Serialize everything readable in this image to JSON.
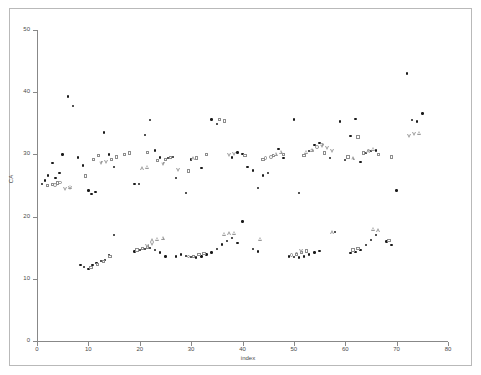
{
  "chart_data": {
    "type": "scatter",
    "title": "",
    "xlabel": "index",
    "ylabel": "CA",
    "xlim": [
      0,
      80
    ],
    "ylim": [
      0,
      50
    ],
    "xticks": [
      0,
      10,
      20,
      30,
      40,
      50,
      60,
      70,
      80
    ],
    "yticks": [
      0,
      10,
      20,
      30,
      40,
      50
    ],
    "grid": false,
    "legend": "none",
    "series": [
      {
        "name": "filled-dot",
        "marker": "dot",
        "color": "#1a1a1a",
        "points": [
          [
            1,
            25.2
          ],
          [
            1.6,
            25.8
          ],
          [
            2.2,
            26.6
          ],
          [
            3,
            28.6
          ],
          [
            3.6,
            26.2
          ],
          [
            4.4,
            27.0
          ],
          [
            5,
            30.0
          ],
          [
            6,
            39.3
          ],
          [
            7,
            37.8
          ],
          [
            8,
            29.5
          ],
          [
            9,
            28.2
          ],
          [
            10,
            24.2
          ],
          [
            10.6,
            23.6
          ],
          [
            11.4,
            24.0
          ],
          [
            13,
            33.5
          ],
          [
            14,
            30.0
          ],
          [
            15,
            28.0
          ],
          [
            19,
            25.2
          ],
          [
            19.8,
            25.2
          ],
          [
            21,
            33.1
          ],
          [
            22,
            35.5
          ],
          [
            23,
            30.6
          ],
          [
            24,
            29.5
          ],
          [
            25.5,
            29.4
          ],
          [
            26.5,
            29.6
          ],
          [
            27,
            26.2
          ],
          [
            29,
            23.8
          ],
          [
            30,
            29.2
          ],
          [
            32,
            27.8
          ],
          [
            34,
            35.6
          ],
          [
            35,
            34.9
          ],
          [
            38,
            29.5
          ],
          [
            39,
            30.3
          ],
          [
            40,
            30.1
          ],
          [
            41,
            28.0
          ],
          [
            42,
            27.4
          ],
          [
            43,
            24.6
          ],
          [
            44,
            26.6
          ],
          [
            45,
            27.0
          ],
          [
            47,
            30.9
          ],
          [
            48,
            29.4
          ],
          [
            50,
            35.6
          ],
          [
            51,
            23.8
          ],
          [
            53,
            30.5
          ],
          [
            54,
            31.5
          ],
          [
            55,
            31.8
          ],
          [
            57,
            29.4
          ],
          [
            59,
            35.3
          ],
          [
            60,
            29.1
          ],
          [
            61,
            33.0
          ],
          [
            62,
            35.7
          ],
          [
            63,
            28.8
          ],
          [
            64,
            30.2
          ],
          [
            65,
            30.5
          ],
          [
            66,
            30.6
          ],
          [
            70,
            24.2
          ],
          [
            72,
            43.0
          ],
          [
            73,
            35.5
          ],
          [
            74,
            35.3
          ],
          [
            75,
            36.6
          ],
          [
            8.5,
            12.2
          ],
          [
            9.2,
            11.9
          ],
          [
            10,
            11.6
          ],
          [
            10.8,
            12.2
          ],
          [
            11.6,
            12.5
          ],
          [
            12.4,
            12.9
          ],
          [
            13.2,
            13.0
          ],
          [
            14,
            13.8
          ],
          [
            15,
            17.0
          ],
          [
            19,
            14.4
          ],
          [
            20,
            14.6
          ],
          [
            21,
            14.8
          ],
          [
            22,
            15.0
          ],
          [
            23,
            14.6
          ],
          [
            24,
            14.2
          ],
          [
            25,
            13.6
          ],
          [
            27,
            13.6
          ],
          [
            28,
            13.9
          ],
          [
            29,
            13.7
          ],
          [
            30,
            13.5
          ],
          [
            31,
            13.4
          ],
          [
            32,
            13.6
          ],
          [
            33,
            13.9
          ],
          [
            34,
            14.2
          ],
          [
            35,
            14.8
          ],
          [
            36,
            15.5
          ],
          [
            37,
            16.1
          ],
          [
            38,
            16.6
          ],
          [
            39,
            15.8
          ],
          [
            40,
            19.2
          ],
          [
            42,
            14.8
          ],
          [
            43,
            14.4
          ],
          [
            49,
            13.6
          ],
          [
            50,
            13.5
          ],
          [
            51,
            13.4
          ],
          [
            52,
            13.6
          ],
          [
            53,
            13.9
          ],
          [
            54,
            14.2
          ],
          [
            55,
            14.5
          ],
          [
            58,
            17.5
          ],
          [
            61,
            14.1
          ],
          [
            62,
            14.3
          ],
          [
            63,
            14.6
          ],
          [
            64,
            15.4
          ],
          [
            65,
            16.2
          ],
          [
            66,
            17.0
          ],
          [
            68,
            16.0
          ],
          [
            69,
            15.4
          ]
        ]
      },
      {
        "name": "open-square",
        "marker": "square",
        "color": "#8d8d8d",
        "points": [
          [
            2,
            25.0
          ],
          [
            3,
            25.2
          ],
          [
            4,
            25.4
          ],
          [
            9.5,
            26.5
          ],
          [
            11,
            29.2
          ],
          [
            12,
            29.8
          ],
          [
            14.5,
            29.2
          ],
          [
            15.5,
            29.6
          ],
          [
            17,
            30.0
          ],
          [
            18,
            30.2
          ],
          [
            21.5,
            30.3
          ],
          [
            23.5,
            29.0
          ],
          [
            25,
            29.2
          ],
          [
            26,
            29.5
          ],
          [
            29.5,
            27.3
          ],
          [
            31,
            29.4
          ],
          [
            33,
            30.0
          ],
          [
            35.5,
            35.6
          ],
          [
            36.5,
            35.4
          ],
          [
            40.5,
            29.8
          ],
          [
            44,
            29.2
          ],
          [
            46,
            29.8
          ],
          [
            48,
            30.0
          ],
          [
            52,
            29.8
          ],
          [
            56,
            30.2
          ],
          [
            60.5,
            29.6
          ],
          [
            62.5,
            32.8
          ],
          [
            63.5,
            30.2
          ],
          [
            66.5,
            30.0
          ],
          [
            69,
            29.6
          ],
          [
            10.5,
            11.8
          ],
          [
            11.8,
            12.3
          ],
          [
            13,
            12.8
          ],
          [
            14.2,
            13.6
          ],
          [
            19.5,
            14.6
          ],
          [
            20.5,
            14.9
          ],
          [
            21.5,
            15.1
          ],
          [
            30.5,
            13.6
          ],
          [
            31.5,
            13.9
          ],
          [
            32.5,
            14.1
          ],
          [
            50.5,
            13.9
          ],
          [
            51.5,
            14.2
          ],
          [
            52.5,
            14.5
          ],
          [
            61.5,
            14.6
          ],
          [
            62.5,
            14.9
          ],
          [
            68.5,
            16.2
          ]
        ]
      },
      {
        "name": "open-circle",
        "marker": "circle",
        "color": "#8d8d8d",
        "points": [
          [
            3.5,
            25.1
          ],
          [
            4.5,
            25.5
          ],
          [
            44.5,
            29.4
          ],
          [
            45.5,
            29.6
          ],
          [
            53.5,
            30.6
          ],
          [
            54.5,
            31.2
          ],
          [
            55.5,
            31.6
          ],
          [
            64.5,
            30.6
          ],
          [
            29.5,
            13.6
          ],
          [
            49.5,
            13.8
          ],
          [
            50.5,
            14.0
          ]
        ]
      },
      {
        "name": "open-tri-up",
        "marker": "tri-up",
        "color": "#9a9a9a",
        "points": [
          [
            6.5,
            24.8
          ],
          [
            20.5,
            27.8
          ],
          [
            21.5,
            28.0
          ],
          [
            30.5,
            29.4
          ],
          [
            46.5,
            30.1
          ],
          [
            47.5,
            30.4
          ],
          [
            52.5,
            30.4
          ],
          [
            53.5,
            30.7
          ],
          [
            61.5,
            29.4
          ],
          [
            64.5,
            30.5
          ],
          [
            65.5,
            30.9
          ],
          [
            74.5,
            33.5
          ],
          [
            22.5,
            16.2
          ],
          [
            23.5,
            16.4
          ],
          [
            24.5,
            16.6
          ],
          [
            36.5,
            17.2
          ],
          [
            37.5,
            17.3
          ],
          [
            38.5,
            17.4
          ],
          [
            43.5,
            16.4
          ],
          [
            57.5,
            17.5
          ],
          [
            65.5,
            18.0
          ],
          [
            66.5,
            17.8
          ]
        ]
      },
      {
        "name": "open-tri-down",
        "marker": "tri-down",
        "color": "#9a9a9a",
        "points": [
          [
            5.5,
            24.4
          ],
          [
            6.5,
            24.6
          ],
          [
            12.5,
            28.6
          ],
          [
            13.5,
            28.8
          ],
          [
            24.5,
            28.5
          ],
          [
            27.5,
            27.5
          ],
          [
            37.5,
            29.9
          ],
          [
            38.5,
            30.1
          ],
          [
            55.5,
            31.4
          ],
          [
            56.5,
            31.0
          ],
          [
            57.5,
            30.6
          ],
          [
            72.5,
            33.0
          ],
          [
            73.5,
            33.3
          ],
          [
            21.5,
            15.2
          ],
          [
            22.5,
            15.6
          ],
          [
            51.5,
            14.4
          ]
        ]
      }
    ]
  },
  "axes": {
    "x_tick_labels": [
      "0",
      "10",
      "20",
      "30",
      "40",
      "50",
      "60",
      "70",
      "80"
    ],
    "y_tick_labels": [
      "0",
      "10",
      "20",
      "30",
      "40",
      "50"
    ],
    "x_title": "index",
    "y_title": "CA"
  },
  "style": {
    "background": "#ffffff",
    "axis_color": "#888888",
    "border_color": "#b9b9b9",
    "dot_color": "#1a1a1a",
    "open_marker_color": "#8d8d8d"
  }
}
